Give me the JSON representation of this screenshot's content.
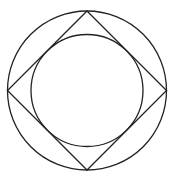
{
  "diagram": {
    "stroke_color": "#222222",
    "background_color": "#ffffff",
    "stroke_width": 1.3,
    "outer_circle": {
      "cx": 87,
      "cy": 90.5,
      "r": 79.5
    },
    "square": {
      "rotation_deg": 45,
      "vertices": [
        {
          "name": "top",
          "x": 87,
          "y": 11
        },
        {
          "name": "right",
          "x": 166.5,
          "y": 90.5
        },
        {
          "name": "bottom",
          "x": 87,
          "y": 170
        },
        {
          "name": "left",
          "x": 7.5,
          "y": 90.5
        }
      ]
    },
    "inner_circle": {
      "cx": 87,
      "cy": 90.5,
      "r": 56
    }
  }
}
